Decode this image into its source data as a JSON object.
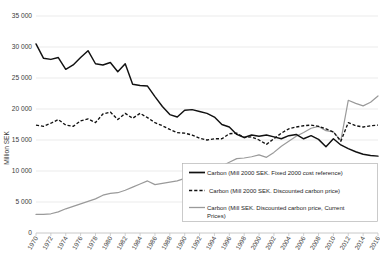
{
  "chart_data": {
    "type": "line",
    "title": "",
    "xlabel": "",
    "ylabel": "Million SEK",
    "ylim": [
      0,
      35000
    ],
    "ytick_labels": [
      "0",
      "5 000",
      "10 000",
      "15 000",
      "20 000",
      "25 000",
      "30 000",
      "35 000"
    ],
    "ytick_values": [
      0,
      5000,
      10000,
      15000,
      20000,
      25000,
      30000,
      35000
    ],
    "grid": true,
    "legend_position": "lower-right",
    "x": [
      1970,
      1971,
      1972,
      1973,
      1974,
      1975,
      1976,
      1977,
      1978,
      1979,
      1980,
      1981,
      1982,
      1983,
      1984,
      1985,
      1986,
      1987,
      1988,
      1989,
      1990,
      1991,
      1992,
      1993,
      1994,
      1995,
      1996,
      1997,
      1998,
      1999,
      2000,
      2001,
      2002,
      2003,
      2004,
      2005,
      2006,
      2007,
      2008,
      2009,
      2010,
      2011,
      2012,
      2013,
      2014,
      2015,
      2016
    ],
    "xtick_labels": [
      "1970",
      "1972",
      "1974",
      "1976",
      "1978",
      "1980",
      "1982",
      "1984",
      "1986",
      "1988",
      "1990",
      "1992",
      "1994",
      "1996",
      "1998",
      "2000",
      "2002",
      "2004",
      "2006",
      "2008",
      "2010",
      "2012",
      "2014",
      "2016"
    ],
    "series": [
      {
        "name": "Carbon (Mill 2000 SEK. Fixed 2000 cost reference)",
        "style": "solid",
        "color": "#111111",
        "values": [
          30500,
          28200,
          28000,
          28300,
          26400,
          27100,
          28300,
          29400,
          27300,
          27100,
          27500,
          26000,
          27300,
          24000,
          23800,
          23700,
          22000,
          20400,
          19100,
          18700,
          19800,
          19900,
          19600,
          19300,
          18700,
          17500,
          17100,
          15900,
          15400,
          15800,
          15600,
          15800,
          15500,
          15200,
          15700,
          15900,
          15200,
          15700,
          15100,
          13900,
          15200,
          14200,
          13600,
          13100,
          12700,
          12500,
          12400
        ]
      },
      {
        "name": "Carbon (Mill 2000 SEK. Discounted carbon price)",
        "style": "dashed",
        "color": "#111111",
        "values": [
          17400,
          17200,
          17700,
          18300,
          17400,
          17200,
          18100,
          18400,
          17800,
          19200,
          19500,
          18300,
          19300,
          18500,
          19300,
          18600,
          17800,
          17300,
          16700,
          16200,
          16100,
          15800,
          15300,
          15000,
          15200,
          15200,
          16000,
          16100,
          15400,
          15500,
          15000,
          14300,
          15200,
          16100,
          16800,
          17100,
          17300,
          17400,
          17200,
          16800,
          16300,
          14800,
          17800,
          17300,
          17100,
          17300,
          17400
        ]
      },
      {
        "name": "Carbon (Mill SEK. Discounted carbon price, Current Prices)",
        "style": "gray",
        "color": "#9a9a9a",
        "values": [
          3000,
          3000,
          3100,
          3400,
          3900,
          4300,
          4700,
          5100,
          5500,
          6100,
          6400,
          6500,
          6900,
          7400,
          7900,
          8400,
          7800,
          8000,
          8200,
          8400,
          8800,
          9100,
          9300,
          9400,
          10000,
          10800,
          11400,
          12000,
          12100,
          12300,
          12600,
          12200,
          13000,
          14000,
          14800,
          15600,
          16200,
          16900,
          17200,
          16500,
          16300,
          14900,
          21400,
          20900,
          20500,
          21100,
          22100
        ]
      }
    ],
    "legend_entries": [
      {
        "label": "Carbon (Mill 2000 SEK. Fixed 2000 cost reference)",
        "style": "solid"
      },
      {
        "label": "Carbon (Mill 2000 SEK. Discounted carbon price)",
        "style": "dashed"
      },
      {
        "label": "Carbon (Mill SEK. Discounted carbon price, Current",
        "style": "gray"
      },
      {
        "label": "Prices)",
        "style": "none"
      }
    ]
  }
}
